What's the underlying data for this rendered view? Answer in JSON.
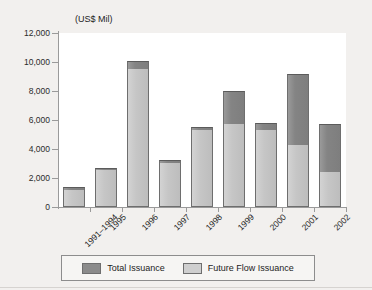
{
  "chart_data": {
    "type": "bar",
    "stacked": true,
    "title": "",
    "subtitle": "",
    "axis_title": "(US$  Mil)",
    "xlabel": "",
    "ylabel": "(US$  Mil)",
    "ylim": [
      0,
      12000
    ],
    "ytick_step": 2000,
    "ytick_labels": [
      "12,000",
      "10,000",
      "8,000",
      "6,000",
      "4,000",
      "2,000",
      "0"
    ],
    "ytick_values": [
      12000,
      10000,
      8000,
      6000,
      4000,
      2000,
      0
    ],
    "grid": false,
    "legend_position": "bottom",
    "categories": [
      "1991–1994",
      "1995",
      "1996",
      "1997",
      "1998",
      "1999",
      "2000",
      "2001",
      "2002"
    ],
    "series": [
      {
        "name": "Future Flow Issuance",
        "color": "#c9c9c9",
        "values": [
          1150,
          2580,
          9500,
          3050,
          5300,
          5700,
          5300,
          4250,
          2400
        ]
      },
      {
        "name": "Total Issuance",
        "color": "#8b8b8b",
        "values": [
          1380,
          2700,
          10050,
          3230,
          5500,
          7980,
          5800,
          9200,
          5700
        ]
      }
    ],
    "note": "Total Issuance is the full bar height; Future Flow Issuance is the lighter lower portion."
  },
  "legend": {
    "items": [
      {
        "label": "Total Issuance",
        "swatch": "total"
      },
      {
        "label": "Future Flow Issuance",
        "swatch": "future"
      }
    ]
  },
  "colors": {
    "total_issuance": "#8b8b8b",
    "future_flow_issuance": "#c9c9c9",
    "axis": "#9a9a9a",
    "text": "#1d1d1d",
    "page_background": "#f2f0ee",
    "plot_background": "#ffffff"
  }
}
